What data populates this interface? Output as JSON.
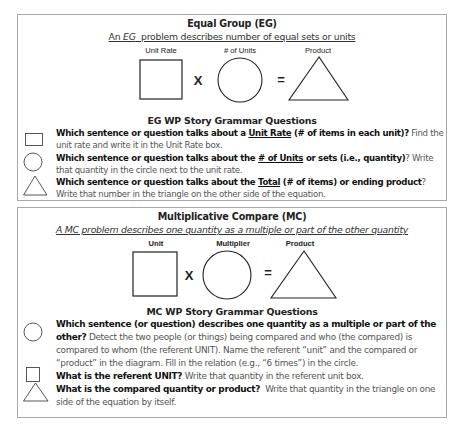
{
  "eg": {
    "title": "Equal Group (EG)",
    "subtitle_pre": "An ",
    "subtitle_em": "EG",
    "subtitle_post": "  problem describes number of equal sets or units",
    "diagram": {
      "labels": [
        "Unit Rate",
        "# of Units",
        "Product"
      ],
      "times": "X",
      "equals": "="
    },
    "questions_heading": "EG WP Story Grammar Questions",
    "questions": [
      {
        "icon": "square-icon",
        "bold_pre": "Which sentence or question talks about a ",
        "bold_underlined": "Unit Rate",
        "bold_post": " (# of items in each unit)?",
        "normal": " Find the unit rate and write it in the Unit Rate box."
      },
      {
        "icon": "circle-icon",
        "bold_pre": "Which sentence or question talks about the ",
        "bold_underlined": "# of Units",
        "bold_post": " or sets (i.e., quantity)",
        "normal": "? Write that quantity in the circle next to the unit rate."
      },
      {
        "icon": "triangle-icon",
        "bold_pre": "Which sentence or question talks about the ",
        "bold_underlined": "Total",
        "bold_post": " (# of items) or ending product",
        "normal": "? Write that number in the triangle on the other side of the equation."
      }
    ]
  },
  "mc": {
    "title": "Multiplicative Compare (MC)",
    "subtitle": "A MC problem describes one quantity as a multiple or part of the other quantity",
    "diagram": {
      "labels": [
        "Unit",
        "Multiplier",
        "Product"
      ],
      "times": "X",
      "equals": "="
    },
    "questions_heading": "MC WP Story Grammar Questions",
    "questions": [
      {
        "icon": "circle-icon",
        "bold": "Which sentence (or question) describes one quantity as a multiple or part of the other?",
        "normal": " Detect the two people (or things) being compared and who (the compared) is compared to whom (the referent UNIT). Name the referent “unit”  and the compared or “product” in the diagram. Fill in the relation (e.g., “6 times”) in the circle."
      },
      {
        "icon": "square-icon",
        "bold": "What is the referent UNIT?",
        "normal": " Write that quantity in the referent unit box."
      },
      {
        "icon": "triangle-icon",
        "bold": "What is the compared quantity or product?",
        "normal": "  Write that quantity in the triangle on one side of the equation by itself."
      }
    ]
  }
}
